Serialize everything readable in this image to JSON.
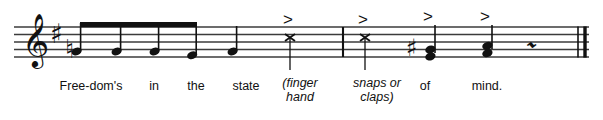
{
  "document": {
    "type": "music-notation-excerpt",
    "background": "#ffffff",
    "ink": "#111111"
  },
  "staff": {
    "name": "five-line-staff",
    "line_color": "#3b3b3b",
    "top_y": 27,
    "line_spacing": 7.5,
    "left_x": 14,
    "right_x": 589,
    "lines": 5
  },
  "clef": {
    "name": "treble-clef",
    "glyph": "𝄞",
    "x": 30
  },
  "key_signature": {
    "name": "key-signature-one-sharp",
    "accidentals": [
      "♯"
    ],
    "sharps": 1,
    "key": "G major / E minor",
    "x": 54
  },
  "barlines": [
    {
      "name": "barline-middle",
      "x": 343,
      "type": "single"
    },
    {
      "name": "final-barline",
      "x": 578,
      "type": "final-double"
    }
  ],
  "notes": [
    {
      "name": "note-1",
      "x": 80,
      "head": "filled-oval",
      "duration": "eighth",
      "beamed": true,
      "staff_pos": 1,
      "accidental": "♮",
      "stem": "up",
      "accent": false
    },
    {
      "name": "note-2",
      "x": 120,
      "head": "filled-oval",
      "duration": "eighth",
      "beamed": true,
      "staff_pos": 1,
      "accidental": "",
      "stem": "up",
      "accent": false
    },
    {
      "name": "note-3",
      "x": 158,
      "head": "filled-oval",
      "duration": "eighth",
      "beamed": true,
      "staff_pos": 1,
      "accidental": "",
      "stem": "up",
      "accent": false
    },
    {
      "name": "note-4",
      "x": 196,
      "head": "filled-oval",
      "duration": "eighth",
      "beamed": true,
      "staff_pos": 0.5,
      "accidental": "",
      "stem": "up",
      "accent": false
    },
    {
      "name": "note-5",
      "x": 236,
      "head": "filled-oval",
      "duration": "quarter",
      "beamed": false,
      "staff_pos": 1,
      "accidental": "",
      "stem": "up",
      "accent": false
    },
    {
      "name": "note-6",
      "x": 290,
      "head": "x-notehead",
      "duration": "quarter",
      "beamed": false,
      "staff_pos": 3,
      "accidental": "",
      "stem": "down",
      "accent": true
    },
    {
      "name": "note-7",
      "x": 365,
      "head": "x-notehead",
      "duration": "quarter",
      "beamed": false,
      "staff_pos": 3,
      "accidental": "",
      "stem": "down",
      "accent": true
    },
    {
      "name": "note-8",
      "x": 430,
      "head": "filled-chord-two-note",
      "duration": "quarter",
      "beamed": false,
      "staff_pos": 1,
      "accidental": "♯",
      "stem": "up",
      "accent": true
    },
    {
      "name": "note-9",
      "x": 487,
      "head": "filled-chord-two-note",
      "duration": "quarter",
      "beamed": false,
      "staff_pos": 1.5,
      "accidental": "",
      "stem": "up",
      "accent": true
    }
  ],
  "beam": {
    "name": "eighth-note-beam",
    "x_start": 80,
    "x_end": 196,
    "y": 24
  },
  "rest": {
    "name": "quarter-rest",
    "glyph": "𝄽",
    "x": 534
  },
  "accents": [
    {
      "name": "accent-mark-1",
      "x": 288,
      "glyph": ">"
    },
    {
      "name": "accent-mark-2",
      "x": 363,
      "glyph": ">"
    },
    {
      "name": "accent-mark-3",
      "x": 428,
      "glyph": ">"
    },
    {
      "name": "accent-mark-4",
      "x": 485,
      "glyph": ">"
    }
  ],
  "lyrics": [
    {
      "name": "lyric-syllable-1",
      "text": "Free-dom's",
      "x": 91,
      "y": 86
    },
    {
      "name": "lyric-syllable-2",
      "text": "in",
      "x": 154,
      "y": 86
    },
    {
      "name": "lyric-syllable-3",
      "text": "the",
      "x": 196,
      "y": 86
    },
    {
      "name": "lyric-syllable-4",
      "text": "state",
      "x": 246,
      "y": 86
    },
    {
      "name": "lyric-syllable-5",
      "text": "of",
      "x": 425,
      "y": 86
    },
    {
      "name": "lyric-syllable-6",
      "text": "mind.",
      "x": 487,
      "y": 86
    }
  ],
  "annotations": [
    {
      "name": "performance-note-finger-hand",
      "line1": "(finger",
      "line2": "hand",
      "x": 300,
      "y": 80
    },
    {
      "name": "performance-note-snaps-claps",
      "line1": "snaps or",
      "line2": "claps)",
      "x": 377,
      "y": 80
    }
  ]
}
